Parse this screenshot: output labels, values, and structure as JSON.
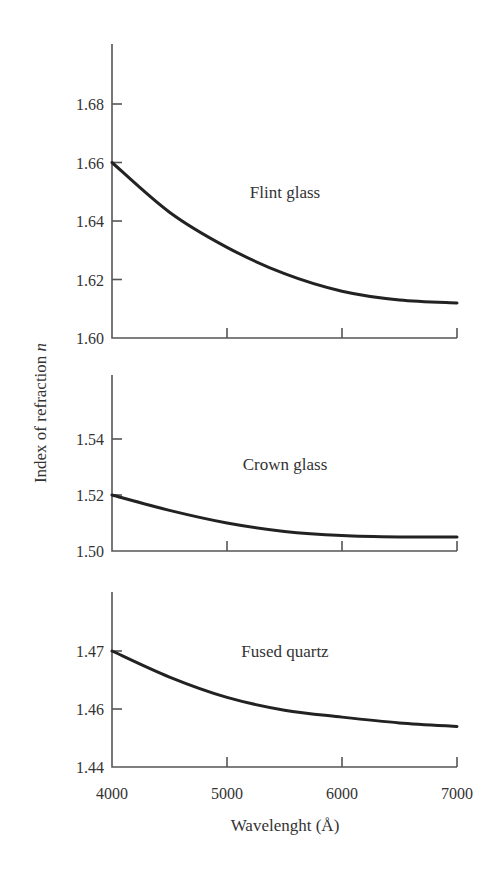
{
  "chart_data": {
    "type": "line",
    "title": "",
    "xlabel": "Wavelenght (Å)",
    "ylabel": "Index of refraction",
    "ylabel_symbol": "n",
    "x": [
      4000,
      4500,
      5000,
      5500,
      6000,
      6500,
      7000
    ],
    "xlim": [
      4000,
      7000
    ],
    "xticks": [
      4000,
      5000,
      6000,
      7000
    ],
    "grid": false,
    "legend": "none (inline panel labels)",
    "panels": [
      {
        "name": "Flint glass",
        "ylim": [
          1.6,
          1.7
        ],
        "yticks": [
          1.6,
          1.62,
          1.64,
          1.66,
          1.68
        ],
        "ytick_labels": [
          "1.60",
          "1.62",
          "1.64",
          "1.66",
          "1.68"
        ],
        "values": [
          1.66,
          1.643,
          1.631,
          1.622,
          1.616,
          1.613,
          1.612
        ]
      },
      {
        "name": "Crown glass",
        "ylim": [
          1.5,
          1.56
        ],
        "yticks": [
          1.5,
          1.52,
          1.54
        ],
        "ytick_labels": [
          "1.50",
          "1.52",
          "1.54"
        ],
        "values": [
          1.52,
          1.5145,
          1.51,
          1.507,
          1.5055,
          1.505,
          1.505
        ]
      },
      {
        "name": "Fused quartz",
        "ylim": [
          1.45,
          1.48
        ],
        "yticks": [
          1.45,
          1.46,
          1.47
        ],
        "ytick_labels": [
          "1.44",
          "1.46",
          "1.47"
        ],
        "values": [
          1.47,
          1.4655,
          1.462,
          1.4598,
          1.4586,
          1.4576,
          1.457
        ]
      }
    ]
  },
  "axis": {
    "xtick_labels": [
      "4000",
      "5000",
      "6000",
      "7000"
    ],
    "xlabel": "Wavelenght (Å)",
    "ylabel": "Index of refraction ",
    "ylabel_symbol": "n"
  },
  "style": {
    "line_color": "#222222",
    "axis_color": "#555555",
    "text_color": "#333333"
  }
}
